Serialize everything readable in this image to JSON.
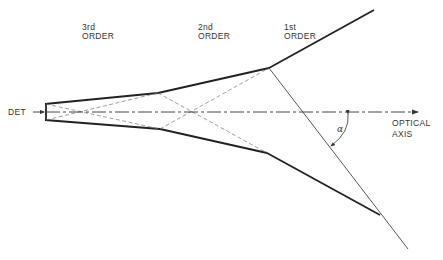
{
  "labels": {
    "third_order_line1": "3rd",
    "third_order_line2": "ORDER",
    "second_order_line1": "2nd",
    "second_order_line2": "ORDER",
    "first_order_line1": "1st",
    "first_order_line2": "ORDER",
    "detector": "DET",
    "optical_axis_line1": "OPTICAL",
    "optical_axis_line2": "AXIS",
    "angle": "α"
  },
  "colors": {
    "line": "#222222",
    "background": "#ffffff"
  }
}
